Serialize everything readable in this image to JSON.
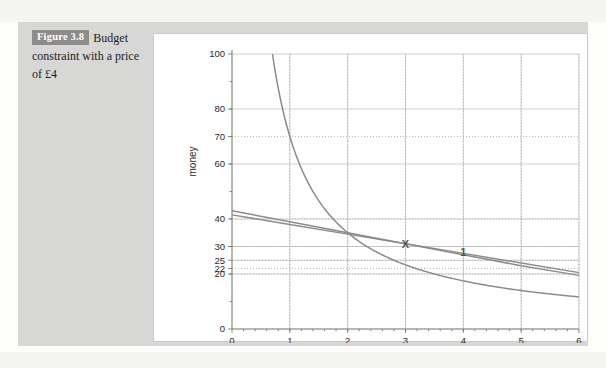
{
  "caption": {
    "badge": "Figure 3.8",
    "text": "Budget constraint with a price of £4"
  },
  "chart_data": {
    "type": "line",
    "title": "",
    "xlabel": "quantity of the good",
    "ylabel": "money",
    "xlim": [
      0,
      6
    ],
    "ylim": [
      0,
      100
    ],
    "xticks": [
      0,
      1,
      2,
      3,
      4,
      5,
      6
    ],
    "xticklabels": [
      "0",
      "1",
      "2",
      "3",
      "4",
      "5",
      "6"
    ],
    "yticks": [
      0,
      20,
      22,
      25,
      30,
      40,
      60,
      70,
      80,
      100
    ],
    "yticklabels": [
      "0",
      "20",
      "22",
      "25",
      "30",
      "40",
      "60",
      "70",
      "80",
      "100"
    ],
    "grid": "both",
    "gridlines_vertical": [
      1,
      2,
      3,
      4,
      5,
      6
    ],
    "gridlines_horizontal_solid": [
      20,
      25,
      30,
      40,
      60,
      80,
      100
    ],
    "gridlines_horizontal_dotted": [
      20,
      22,
      25,
      30,
      40,
      70
    ],
    "legend": null,
    "series": [
      {
        "name": "indifference curve",
        "type": "hyperbola",
        "equation": "money = 70 / quantity",
        "constant": 70,
        "points": [
          {
            "x": 0.7,
            "y": 100
          },
          {
            "x": 1.0,
            "y": 70
          },
          {
            "x": 1.5,
            "y": 46.7
          },
          {
            "x": 2.0,
            "y": 35
          },
          {
            "x": 2.5,
            "y": 28
          },
          {
            "x": 3.0,
            "y": 23.3
          },
          {
            "x": 3.5,
            "y": 20
          },
          {
            "x": 4.0,
            "y": 17.5
          },
          {
            "x": 5.0,
            "y": 14
          },
          {
            "x": 6.0,
            "y": 11.7
          }
        ]
      },
      {
        "name": "budget constraint",
        "type": "straight",
        "equation": "money = 41.5 - 3.5 * quantity",
        "points": [
          {
            "x": 0.0,
            "y": 41.5
          },
          {
            "x": 1.0,
            "y": 38
          },
          {
            "x": 2.0,
            "y": 34.5
          },
          {
            "x": 3.0,
            "y": 31
          },
          {
            "x": 4.0,
            "y": 27.5
          },
          {
            "x": 5.0,
            "y": 24
          },
          {
            "x": 6.0,
            "y": 20.5
          }
        ]
      },
      {
        "name": "budget constraint price 4",
        "type": "straight",
        "equation": "money = 43 - 4 * quantity",
        "points": [
          {
            "x": 0.0,
            "y": 43
          },
          {
            "x": 1.0,
            "y": 39
          },
          {
            "x": 2.0,
            "y": 35
          },
          {
            "x": 3.0,
            "y": 31
          },
          {
            "x": 4.0,
            "y": 27
          },
          {
            "x": 5.0,
            "y": 23
          },
          {
            "x": 6.0,
            "y": 19.5
          }
        ]
      }
    ],
    "annotations": [
      {
        "label": "X",
        "x": 3.0,
        "y": 31
      },
      {
        "label": "1",
        "x": 4.0,
        "y": 28
      }
    ]
  },
  "colors": {
    "badge_bg": "#8c8c8a",
    "panel_bg": "#d7d7d5",
    "plot_bg": "#ffffff",
    "curve": "#8e8b86",
    "grid_solid": "#c2c2c0",
    "grid_dotted": "#a9a9a7",
    "axis": "#6e6e6c"
  }
}
